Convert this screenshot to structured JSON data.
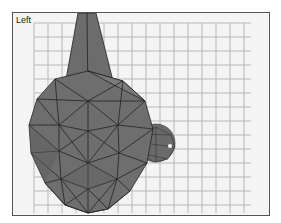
{
  "viewport": {
    "label": "Left",
    "background": "#f4f4f4",
    "grid_color": "#b8b8b8",
    "mesh_fill": "#6e6e6e",
    "mesh_edge": "#222222"
  },
  "scene": {
    "objects": [
      {
        "name": "large-geosphere",
        "type": "geosphere"
      },
      {
        "name": "cone",
        "type": "cone"
      },
      {
        "name": "small-geosphere",
        "type": "geosphere"
      }
    ]
  }
}
